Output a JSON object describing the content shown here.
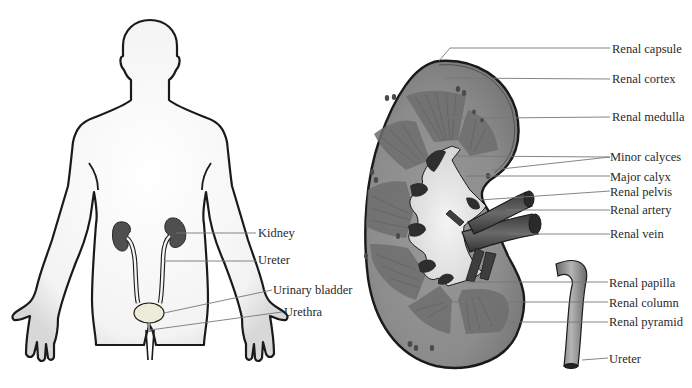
{
  "figure": {
    "left_panel": {
      "title": "Urinary system (body outline)",
      "labels": [
        {
          "text": "Kidney",
          "x": 258,
          "y": 228
        },
        {
          "text": "Ureter",
          "x": 258,
          "y": 255
        },
        {
          "text": "Urinary bladder",
          "x": 273,
          "y": 285
        },
        {
          "text": "Urethra",
          "x": 284,
          "y": 307
        }
      ]
    },
    "right_panel": {
      "title": "Kidney cross-section",
      "labels": [
        {
          "text": "Renal capsule",
          "x": 612,
          "y": 44
        },
        {
          "text": "Renal cortex",
          "x": 612,
          "y": 74
        },
        {
          "text": "Renal medulla",
          "x": 612,
          "y": 111
        },
        {
          "text": "Minor calyces",
          "x": 610,
          "y": 151
        },
        {
          "text": "Major calyx",
          "x": 610,
          "y": 171
        },
        {
          "text": "Renal pelvis",
          "x": 610,
          "y": 186
        },
        {
          "text": "Renal artery",
          "x": 610,
          "y": 204
        },
        {
          "text": "Renal vein",
          "x": 610,
          "y": 228
        },
        {
          "text": "Renal papilla",
          "x": 609,
          "y": 277
        },
        {
          "text": "Renal column",
          "x": 609,
          "y": 297
        },
        {
          "text": "Renal pyramid",
          "x": 609,
          "y": 316
        },
        {
          "text": "Ureter",
          "x": 609,
          "y": 353
        }
      ]
    },
    "colors": {
      "outline": "#1a1a1a",
      "kidney_fill": "#555555",
      "cortex": "#8a8a8a",
      "medulla": "#6c6c6c",
      "pelvis": "#e2e2e2",
      "vessel": "#4a4a4a",
      "leader_line": "#777777",
      "text": "#2a2a2a"
    }
  }
}
